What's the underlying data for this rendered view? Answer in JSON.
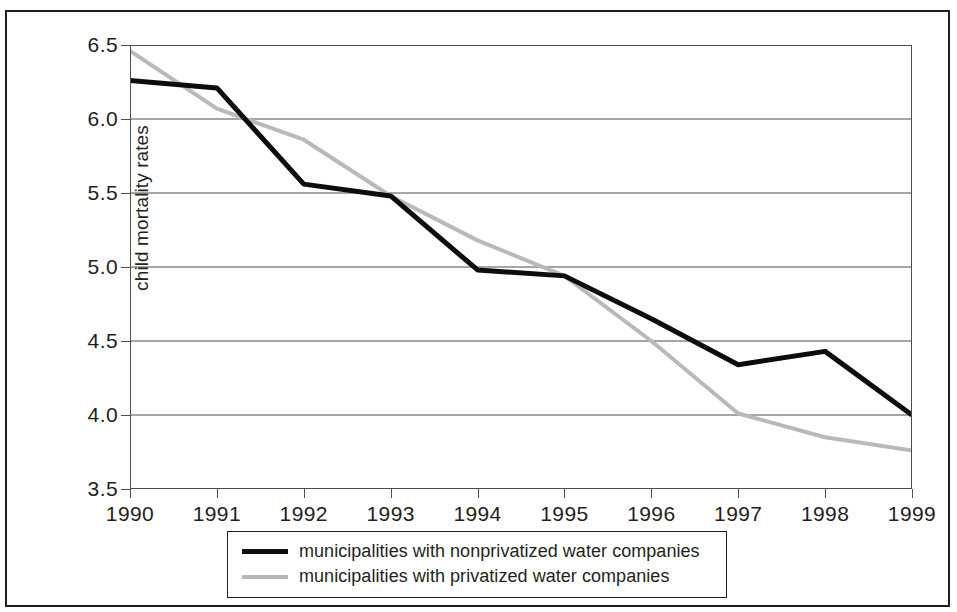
{
  "chart_data": {
    "type": "line",
    "title": "",
    "xlabel": "",
    "ylabel": "child mortality rates",
    "x": [
      1990,
      1991,
      1992,
      1993,
      1994,
      1995,
      1996,
      1997,
      1998,
      1999
    ],
    "categories": [
      "1990",
      "1991",
      "1992",
      "1993",
      "1994",
      "1995",
      "1996",
      "1997",
      "1998",
      "1999"
    ],
    "xlim": [
      1990,
      1999
    ],
    "ylim": [
      3.5,
      6.5
    ],
    "yticks": [
      3.5,
      4.0,
      4.5,
      5.0,
      5.5,
      6.0,
      6.5
    ],
    "ytick_labels": [
      "3.5",
      "4.0",
      "4.5",
      "5.0",
      "5.5",
      "6.0",
      "6.5"
    ],
    "grid": "horizontal",
    "legend_position": "bottom",
    "series": [
      {
        "name": "municipalities with nonprivatized water companies",
        "color": "#0d0d0d",
        "width": 5,
        "values": [
          6.26,
          6.21,
          5.56,
          5.48,
          4.98,
          4.94,
          4.65,
          4.34,
          4.43,
          4.0
        ]
      },
      {
        "name": "municipalities with privatized water companies",
        "color": "#b9b9b9",
        "width": 4,
        "values": [
          6.46,
          6.07,
          5.86,
          5.48,
          5.18,
          4.94,
          4.5,
          4.01,
          3.85,
          3.76
        ]
      }
    ]
  },
  "legend": {
    "entries": [
      {
        "label": "municipalities with nonprivatized water companies",
        "color": "#0d0d0d",
        "thickness": "5px"
      },
      {
        "label": "municipalities with privatized water companies",
        "color": "#b9b9b9",
        "thickness": "4px"
      }
    ]
  },
  "axes": {
    "y_title": "child mortality rates"
  }
}
